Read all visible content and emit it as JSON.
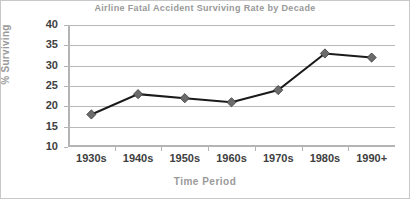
{
  "chart_data": {
    "type": "line",
    "title": "Airline Fatal Accident Surviving Rate by Decade",
    "xlabel": "Time Period",
    "ylabel": "% Surviving",
    "categories": [
      "1930s",
      "1940s",
      "1950s",
      "1960s",
      "1970s",
      "1980s",
      "1990+"
    ],
    "values": [
      18,
      23,
      22,
      21,
      24,
      33,
      32
    ],
    "yticks": [
      10,
      15,
      20,
      25,
      30,
      35,
      40
    ],
    "ylim": [
      10,
      40
    ],
    "grid": true,
    "legend": false,
    "marker": "diamond",
    "series_color": "#6b6b6b",
    "line_color": "#1a1a1a",
    "grid_color": "#b9b9b9",
    "axis_color": "#b4b4b4",
    "tick_label_color": "#404040",
    "title_color": "#999999",
    "axis_title_color": "#9a9a9a",
    "background_color": "#ffffff",
    "border_color": "#c8c8c8"
  }
}
